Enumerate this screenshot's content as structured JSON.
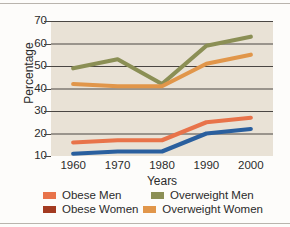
{
  "chart_data": {
    "type": "line",
    "title": "",
    "xlabel": "Years",
    "ylabel": "Percentage",
    "x": [
      1960,
      1970,
      1980,
      1990,
      2000
    ],
    "categories": [
      "1960",
      "1970",
      "1980",
      "1990",
      "2000"
    ],
    "xlim": [
      1955,
      2005
    ],
    "ylim": [
      10,
      70
    ],
    "yticks": [
      10,
      20,
      30,
      40,
      50,
      60,
      70
    ],
    "ytick_labels": [
      "10",
      "20",
      "30",
      "40",
      "50",
      "60",
      "70"
    ],
    "grid": "horizontal",
    "legend_position": "bottom",
    "plot_background": "#e9e2d6",
    "series": [
      {
        "name": "Obese Men",
        "color": "#e8734a",
        "values": [
          16,
          17,
          17,
          25,
          27
        ]
      },
      {
        "name": "Obese Women",
        "color": "#a33a20",
        "line_color": "#2a5f9e",
        "values": [
          11,
          12,
          12,
          20,
          22
        ]
      },
      {
        "name": "Overweight Men",
        "color": "#8b8f55",
        "values": [
          49,
          53,
          42,
          59,
          63
        ]
      },
      {
        "name": "Overweight Women",
        "color": "#e1964a",
        "values": [
          42,
          41,
          41,
          51,
          55
        ]
      }
    ]
  },
  "legend": {
    "rows": [
      {
        "left_label": "Obese Men",
        "left_color": "#e8734a",
        "right_label": "Overweight Men",
        "right_color": "#8b8f55"
      },
      {
        "left_label": "Obese Women",
        "left_color": "#a33a20",
        "right_label": "Overweight Women",
        "right_color": "#e1964a"
      }
    ]
  }
}
